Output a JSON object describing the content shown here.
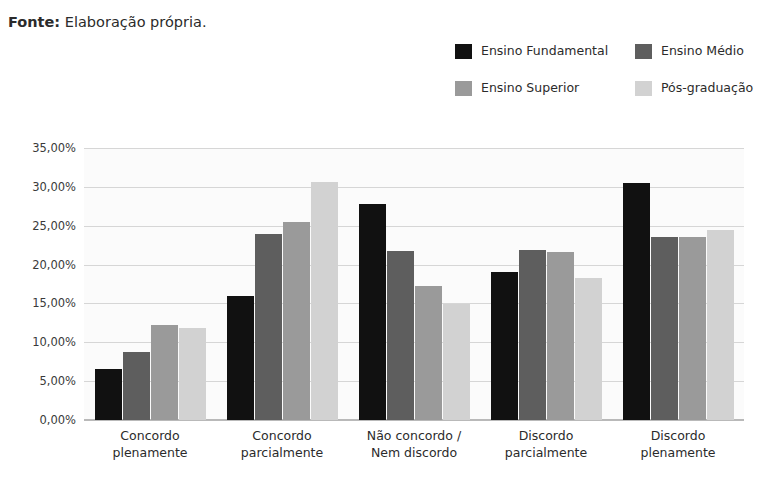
{
  "source": {
    "label": "Fonte:",
    "text": " Elaboração própria."
  },
  "legend": {
    "items": [
      {
        "label": "Ensino Fundamental",
        "color": "#111111"
      },
      {
        "label": "Ensino Médio",
        "color": "#5e5e5e"
      },
      {
        "label": "Ensino Superior",
        "color": "#9a9a9a"
      },
      {
        "label": "Pós-graduação",
        "color": "#d2d2d2"
      }
    ]
  },
  "chart_data": {
    "type": "bar",
    "title": "",
    "xlabel": "",
    "ylabel": "",
    "ylim": [
      0,
      35
    ],
    "yticks": [
      "0,00%",
      "5,00%",
      "10,00%",
      "15,00%",
      "20,00%",
      "25,00%",
      "30,00%",
      "35,00%"
    ],
    "ytick_values": [
      0,
      5,
      10,
      15,
      20,
      25,
      30,
      35
    ],
    "grid": true,
    "legend_position": "top-right",
    "categories": [
      [
        "Concordo",
        "plenamente"
      ],
      [
        "Concordo",
        "parcialmente"
      ],
      [
        "Não concordo /",
        "Nem discordo"
      ],
      [
        "Discordo",
        "parcialmente"
      ],
      [
        "Discordo",
        "plenamente"
      ]
    ],
    "category_labels": [
      "Concordo plenamente",
      "Concordo parcialmente",
      "Não concordo / Nem discordo",
      "Discordo parcialmente",
      "Discordo plenamente"
    ],
    "series": [
      {
        "name": "Ensino Fundamental",
        "color": "#111111",
        "values": [
          6.6,
          16.0,
          27.8,
          19.0,
          30.5
        ]
      },
      {
        "name": "Ensino Médio",
        "color": "#5e5e5e",
        "values": [
          8.7,
          23.9,
          21.8,
          21.9,
          23.5
        ]
      },
      {
        "name": "Ensino Superior",
        "color": "#9a9a9a",
        "values": [
          12.2,
          25.5,
          17.2,
          21.6,
          23.6
        ]
      },
      {
        "name": "Pós-graduação",
        "color": "#d2d2d2",
        "values": [
          11.9,
          30.6,
          14.9,
          18.3,
          24.5
        ]
      }
    ]
  }
}
